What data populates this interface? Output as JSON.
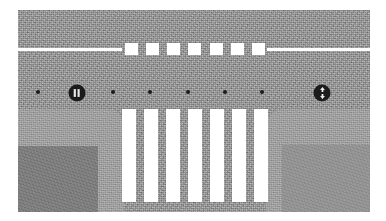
{
  "scene": {
    "title": "Aerial road intersection schematic",
    "type": "top-down-map",
    "frame": {
      "x": 18,
      "y": 10,
      "width": 352,
      "height": 202
    },
    "colors": {
      "asphalt": "#9a9a9a",
      "sidewalk": "#a4a4a4",
      "building": "#7d7d7d",
      "marking_white": "#ffffff",
      "marker_black": "#191919",
      "badge_dark": "#1b1b1b",
      "page_background": "#ffffff"
    }
  },
  "lane_line": {
    "label": "center lane divider",
    "solid_left": {
      "x": 0,
      "y": 38,
      "width": 104,
      "height": 3
    },
    "solid_right": {
      "x": 249,
      "y": 38,
      "width": 103,
      "height": 3
    },
    "dashes": {
      "count": 7,
      "x": 107,
      "y": 33,
      "width": 140,
      "height": 12,
      "dash_width": 13,
      "labels": [
        "dash-1",
        "dash-2",
        "dash-3",
        "dash-4",
        "dash-5",
        "dash-6",
        "dash-7"
      ]
    }
  },
  "crosswalk": {
    "label": "zebra crossing",
    "count": 7,
    "x": 104,
    "y": 99,
    "width": 146,
    "height": 93,
    "stripe_width": 14,
    "labels": [
      "zebra-1",
      "zebra-2",
      "zebra-3",
      "zebra-4",
      "zebra-5",
      "zebra-6",
      "zebra-7"
    ]
  },
  "markers": {
    "label": "survey point row",
    "row_y": 82,
    "dots": [
      {
        "name": "point-1",
        "x": 20
      },
      {
        "name": "point-2",
        "x": 95
      },
      {
        "name": "point-3",
        "x": 132
      },
      {
        "name": "point-4",
        "x": 170
      },
      {
        "name": "point-5",
        "x": 207
      },
      {
        "name": "point-6",
        "x": 244
      }
    ],
    "badges": [
      {
        "name": "traffic-signal-icon",
        "icon": "traffic-signal-icon",
        "x": 59,
        "y": 83,
        "glyph": "bars"
      },
      {
        "name": "two-way-arrow-icon",
        "icon": "two-way-arrow-icon",
        "x": 304,
        "y": 83,
        "glyph": "arrows"
      }
    ]
  },
  "sidewalks": {
    "left": {
      "name": "sidewalk-left",
      "x": 0,
      "y": 99,
      "width": 106,
      "height": 103,
      "building": {
        "name": "building-left",
        "x": 0,
        "y": 136,
        "width": 80,
        "height": 66
      }
    },
    "right": {
      "name": "sidewalk-right",
      "x": 248,
      "y": 99,
      "width": 104,
      "height": 103,
      "building": {
        "name": "building-right",
        "x": 16,
        "y": 36,
        "width": 88,
        "height": 67
      }
    }
  }
}
